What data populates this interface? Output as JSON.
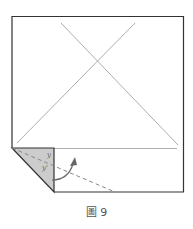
{
  "figure": {
    "caption": "圖 9",
    "labels": {
      "angle_top": "y",
      "angle_bottom": "y'"
    },
    "colors": {
      "outline": "#333333",
      "crease": "#999999",
      "flap_fill": "#cccccc",
      "dashed_fold": "#888888",
      "arrow": "#666666"
    }
  }
}
